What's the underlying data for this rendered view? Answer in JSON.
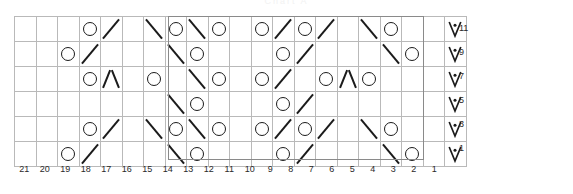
{
  "title": "Chart A",
  "chart_data": {
    "type": "table",
    "title": "Chart A",
    "stitch_count": 21,
    "row_count": 6,
    "row_labels": [
      "11",
      "9",
      "7",
      "5",
      "3",
      "1"
    ],
    "column_labels": [
      "21",
      "20",
      "19",
      "18",
      "17",
      "16",
      "15",
      "14",
      "13",
      "12",
      "11",
      "10",
      "9",
      "8",
      "7",
      "6",
      "5",
      "4",
      "3",
      "2",
      "1"
    ],
    "legend": [
      {
        "symbol": "O",
        "key": "o",
        "name": "yarn-over"
      },
      {
        "symbol": "/",
        "key": "k2tog",
        "name": "right-leaning-decrease"
      },
      {
        "symbol": "\\",
        "key": "ssk",
        "name": "left-leaning-decrease"
      },
      {
        "symbol": "Λ",
        "key": "cdd",
        "name": "central-double-decrease"
      },
      {
        "symbol": "V•",
        "key": "vdot",
        "name": "knit-through-back-loop-with-dot"
      }
    ],
    "repeat_box": {
      "from_column": "15",
      "to_column": "6",
      "columns_spanned": 10
    },
    "grid_line_color": "#b9b9b9",
    "repeat_box_color": "#8a8a8a",
    "symbol_color": "#1b1b1b",
    "rows": [
      {
        "row": "11",
        "cells": [
          "",
          "",
          "",
          "o",
          "k2tog",
          "",
          "ssk",
          "o",
          "ssk",
          "o",
          "",
          "o",
          "k2tog",
          "o",
          "k2tog",
          "",
          "ssk",
          "o",
          "",
          "",
          "vdot"
        ]
      },
      {
        "row": "9",
        "cells": [
          "",
          "",
          "o",
          "k2tog",
          "",
          "",
          "",
          "ssk",
          "o",
          "",
          "",
          "",
          "o",
          "k2tog",
          "",
          "",
          "",
          "ssk",
          "o",
          "",
          "vdot"
        ]
      },
      {
        "row": "7",
        "cells": [
          "",
          "",
          "",
          "o",
          "cdd",
          "",
          "o",
          "",
          "ssk",
          "o",
          "",
          "o",
          "k2tog",
          "",
          "o",
          "cdd",
          "o",
          "",
          "",
          "",
          "vdot"
        ]
      },
      {
        "row": "5",
        "cells": [
          "",
          "",
          "",
          "",
          "",
          "",
          "",
          "ssk",
          "o",
          "",
          "",
          "",
          "o",
          "k2tog",
          "",
          "",
          "",
          "",
          "",
          "",
          "vdot"
        ]
      },
      {
        "row": "3",
        "cells": [
          "",
          "",
          "",
          "o",
          "k2tog",
          "",
          "ssk",
          "o",
          "ssk",
          "o",
          "",
          "o",
          "k2tog",
          "o",
          "k2tog",
          "",
          "ssk",
          "o",
          "",
          "",
          "vdot"
        ]
      },
      {
        "row": "1",
        "cells": [
          "",
          "",
          "o",
          "k2tog",
          "",
          "",
          "",
          "ssk",
          "o",
          "",
          "",
          "",
          "o",
          "k2tog",
          "",
          "",
          "",
          "ssk",
          "o",
          "",
          "vdot"
        ]
      }
    ]
  }
}
